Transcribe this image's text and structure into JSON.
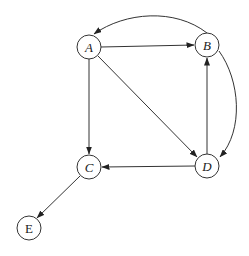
{
  "diagram": {
    "type": "directed-graph",
    "nodes": [
      {
        "id": "A",
        "label": "A",
        "x": 89,
        "y": 47,
        "italic": true
      },
      {
        "id": "B",
        "label": "B",
        "x": 207,
        "y": 45,
        "italic": true
      },
      {
        "id": "C",
        "label": "C",
        "x": 89,
        "y": 167,
        "italic": true
      },
      {
        "id": "D",
        "label": "D",
        "x": 207,
        "y": 166,
        "italic": true
      },
      {
        "id": "E",
        "label": "E",
        "x": 29,
        "y": 228,
        "italic": false
      }
    ],
    "edges": [
      {
        "from": "A",
        "to": "B"
      },
      {
        "from": "A",
        "to": "C"
      },
      {
        "from": "A",
        "to": "D"
      },
      {
        "from": "D",
        "to": "B"
      },
      {
        "from": "D",
        "to": "C"
      },
      {
        "from": "B",
        "to": "D",
        "curved": true
      },
      {
        "from": "B",
        "to": "A",
        "curved": true
      },
      {
        "from": "C",
        "to": "E"
      }
    ]
  }
}
